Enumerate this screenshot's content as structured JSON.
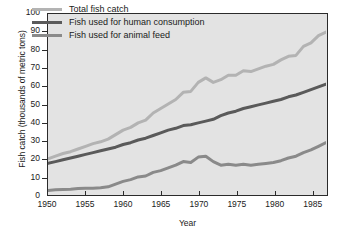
{
  "chart_data": {
    "type": "line",
    "title": "",
    "xlabel": "Year",
    "ylabel": "Fish catch (thousands of metric tons)",
    "xlim": [
      1950,
      1987
    ],
    "ylim": [
      0,
      100
    ],
    "ytick_step": 10,
    "xtick_step": 5,
    "grid": false,
    "legend_position": "top-left-inside",
    "x_tick_labels": [
      "1950",
      "1955",
      "1960",
      "1965",
      "1970",
      "1975",
      "1980",
      "1985"
    ],
    "y_tick_labels": [
      "0",
      "10",
      "20",
      "30",
      "40",
      "50",
      "60",
      "70",
      "80",
      "90",
      "100"
    ],
    "x": [
      1950,
      1951,
      1952,
      1953,
      1954,
      1955,
      1956,
      1957,
      1958,
      1959,
      1960,
      1961,
      1962,
      1963,
      1964,
      1965,
      1966,
      1967,
      1968,
      1969,
      1970,
      1971,
      1972,
      1973,
      1974,
      1975,
      1976,
      1977,
      1978,
      1979,
      1980,
      1981,
      1982,
      1983,
      1984,
      1985,
      1986,
      1987
    ],
    "series": [
      {
        "name": "Total fish catch",
        "color": "#b3b3b3",
        "values": [
          19.5,
          21.0,
          22.5,
          23.5,
          25.0,
          26.5,
          28.0,
          29.0,
          30.5,
          33.0,
          35.5,
          37.0,
          39.5,
          41.0,
          45.0,
          47.5,
          50.0,
          52.5,
          56.5,
          57.0,
          62.0,
          64.5,
          62.0,
          63.5,
          66.0,
          66.0,
          68.5,
          68.0,
          69.5,
          71.0,
          72.0,
          74.5,
          76.5,
          77.0,
          82.0,
          84.0,
          88.0,
          90.0
        ]
      },
      {
        "name": "Fish used for human consumption",
        "color": "#5a5a5a",
        "values": [
          17.0,
          18.0,
          19.0,
          20.0,
          21.0,
          22.0,
          23.0,
          24.0,
          25.0,
          26.0,
          27.5,
          28.5,
          30.0,
          31.0,
          32.5,
          34.0,
          35.5,
          36.5,
          38.0,
          38.5,
          39.5,
          40.5,
          41.5,
          43.5,
          45.0,
          46.0,
          47.5,
          48.5,
          49.5,
          50.5,
          51.5,
          52.5,
          54.0,
          55.0,
          56.5,
          58.0,
          59.5,
          61.0
        ]
      },
      {
        "name": "Fish used for animal feed",
        "color": "#8a8a8a",
        "values": [
          2.0,
          2.3,
          2.5,
          2.7,
          3.0,
          3.2,
          3.2,
          3.5,
          4.0,
          5.5,
          7.0,
          8.0,
          9.5,
          10.0,
          12.0,
          13.0,
          14.5,
          16.0,
          18.0,
          17.5,
          20.5,
          21.0,
          18.0,
          16.0,
          16.5,
          16.0,
          16.5,
          16.0,
          16.5,
          17.0,
          17.5,
          18.5,
          20.0,
          21.0,
          23.0,
          24.5,
          26.5,
          28.5
        ]
      }
    ]
  },
  "legend": {
    "items": [
      {
        "label": "Total fish catch",
        "color": "#b3b3b3"
      },
      {
        "label": "Fish used for human consumption",
        "color": "#5a5a5a"
      },
      {
        "label": "Fish used for animal feed",
        "color": "#8a8a8a"
      }
    ]
  },
  "axes": {
    "y_title": "Fish catch (thousands of metric tons)",
    "x_title": "Year"
  },
  "colors": {
    "plot_background": "#e3e3e3",
    "frame": "#2b2b2b",
    "text": "#1a1a1a"
  }
}
